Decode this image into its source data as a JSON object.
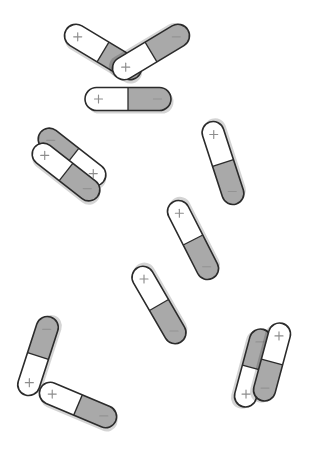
{
  "scene": {
    "title": "Bar magnet arrangement",
    "width": 311,
    "height": 449,
    "background_color": "#ffffff",
    "outline_color": "#2b2b2b",
    "north_pole_color": "#ffffff",
    "south_pole_color": "#a9a9a9",
    "glyph_color": "#8d8d8d",
    "shadow_color": "#000000",
    "magnet_count": 11,
    "group_count": 5
  },
  "legend": {
    "north_label": "+",
    "south_label": "−",
    "north_name": "north-pole",
    "south_name": "south-pole"
  },
  "groups": [
    {
      "name": "triangle-cluster",
      "label": "triangle",
      "magnet_count": 3,
      "magnets": [
        {
          "name": "triangle-left-rod",
          "cx": 103,
          "cy": 52,
          "angle": 31,
          "length": 86,
          "width": 23,
          "south_end": "head",
          "north_label": "+",
          "south_label": "−",
          "north_at": "tail",
          "south_at": "head"
        },
        {
          "name": "triangle-right-rod",
          "cx": 151,
          "cy": 52,
          "angle": 149,
          "length": 86,
          "width": 23,
          "south_end": "tail",
          "north_label": "+",
          "south_label": "−",
          "north_at": "head",
          "south_at": "tail"
        },
        {
          "name": "triangle-bottom-rod",
          "cx": 128,
          "cy": 99,
          "angle": 0,
          "length": 86,
          "width": 23,
          "south_end": "head",
          "north_label": "+",
          "south_label": "−",
          "north_at": "tail",
          "south_at": "head"
        }
      ]
    },
    {
      "name": "left-parallel-pair",
      "label": "parallel pair",
      "magnet_count": 2,
      "magnets": [
        {
          "name": "left-pair-upper-rod",
          "cx": 72,
          "cy": 157,
          "angle": 38,
          "length": 80,
          "width": 22,
          "south_end": "tail",
          "north_label": "+",
          "south_label": "−",
          "north_at": "head",
          "south_at": "tail"
        },
        {
          "name": "left-pair-lower-rod",
          "cx": 66,
          "cy": 172,
          "angle": 38,
          "length": 80,
          "width": 22,
          "south_end": "head",
          "north_label": "+",
          "south_label": "−",
          "north_at": "tail",
          "south_at": "head"
        }
      ]
    },
    {
      "name": "right-chain",
      "label": "three-magnet chain",
      "magnet_count": 3,
      "magnets": [
        {
          "name": "chain-top-rod",
          "cx": 223,
          "cy": 163,
          "angle": 252,
          "length": 86,
          "width": 22,
          "south_end": "tail",
          "north_label": "+",
          "south_label": "−",
          "north_at": "head",
          "south_at": "tail"
        },
        {
          "name": "chain-middle-rod",
          "cx": 193,
          "cy": 240,
          "angle": 243,
          "length": 86,
          "width": 22,
          "south_end": "tail",
          "north_label": "+",
          "south_label": "−",
          "north_at": "head",
          "south_at": "tail"
        },
        {
          "name": "chain-bottom-rod",
          "cx": 159,
          "cy": 305,
          "angle": 240,
          "length": 86,
          "width": 22,
          "south_end": "tail",
          "north_label": "+",
          "south_label": "−",
          "north_at": "head",
          "south_at": "tail"
        }
      ]
    },
    {
      "name": "bottom-left-vee",
      "label": "v pair",
      "magnet_count": 2,
      "magnets": [
        {
          "name": "vee-upper-rod",
          "cx": 38,
          "cy": 356,
          "angle": 288,
          "length": 82,
          "width": 22,
          "south_end": "head",
          "north_label": "+",
          "south_label": "−",
          "north_at": "tail",
          "south_at": "head"
        },
        {
          "name": "vee-lower-rod",
          "cx": 78,
          "cy": 405,
          "angle": 23,
          "length": 82,
          "width": 22,
          "south_end": "head",
          "north_label": "+",
          "south_label": "−",
          "north_at": "tail",
          "south_at": "head"
        }
      ]
    },
    {
      "name": "bottom-right-pair",
      "label": "parallel pair",
      "magnet_count": 2,
      "magnets": [
        {
          "name": "right-pair-left-rod",
          "cx": 253,
          "cy": 368,
          "angle": 105,
          "length": 80,
          "width": 22,
          "south_end": "tail",
          "north_label": "+",
          "south_label": "−",
          "north_at": "head",
          "south_at": "tail"
        },
        {
          "name": "right-pair-right-rod",
          "cx": 272,
          "cy": 362,
          "angle": 105,
          "length": 80,
          "width": 22,
          "south_end": "head",
          "north_label": "+",
          "south_label": "−",
          "north_at": "tail",
          "south_at": "head"
        }
      ]
    }
  ]
}
